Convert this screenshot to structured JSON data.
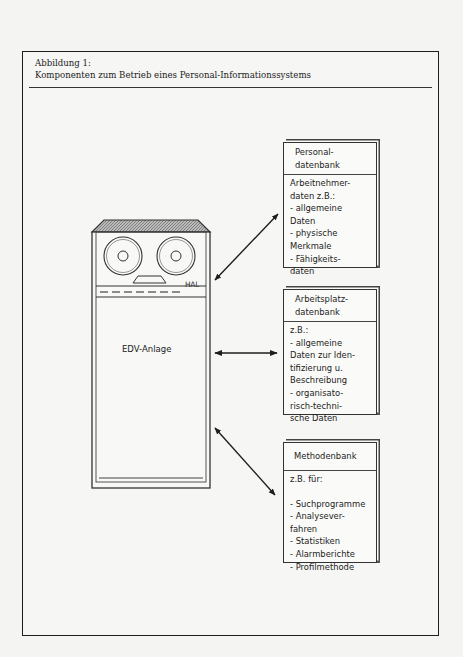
{
  "figure": {
    "label": "Abbildung 1:",
    "title": "Komponenten zum Betrieb eines Personal-Informationssystems"
  },
  "machine": {
    "label": "EDV-Anlage",
    "brand": "HAL",
    "icon": "tape-reel-computer"
  },
  "boxes": [
    {
      "title": "Personal-\ndatenbank",
      "body": "Arbeitnehmer-\ndaten z.B.:\n- allgemeine\nDaten\n- physische\nMerkmale\n- Fähigkeits-\ndaten"
    },
    {
      "title": "Arbeitsplatz-\ndatenbank",
      "body": "z.B.:\n- allgemeine\nDaten zur Iden-\ntifizierung u.\nBeschreibung\n- organisato-\nrisch-techni-\nsche Daten"
    },
    {
      "title": "Methodenbank",
      "body": "z.B. für:\n\n- Suchprogramme\n- Analysever-\nfahren\n- Statistiken\n- Alarmberichte\n- Profilmethode"
    }
  ],
  "connections": [
    {
      "from": "EDV-Anlage",
      "to": "Personaldatenbank",
      "type": "bidirectional"
    },
    {
      "from": "EDV-Anlage",
      "to": "Arbeitsplatzdatenbank",
      "type": "bidirectional"
    },
    {
      "from": "EDV-Anlage",
      "to": "Methodenbank",
      "type": "bidirectional"
    }
  ]
}
